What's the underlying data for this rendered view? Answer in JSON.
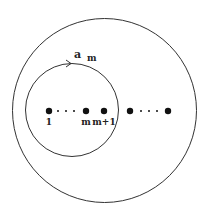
{
  "diagram": {
    "outer_circle": {
      "cx": 104.5,
      "cy": 110.5,
      "r": 92
    },
    "inner_circle": {
      "cx": 72,
      "cy": 110,
      "r": 46.5
    },
    "loop_label": {
      "main": "a",
      "sub": "m"
    },
    "points": [
      {
        "x": 49,
        "label": "1"
      },
      {
        "x": 86,
        "label": "m"
      },
      {
        "x": 104,
        "label": "m+1"
      },
      {
        "x": 130,
        "label": ""
      },
      {
        "x": 168,
        "label": ""
      }
    ],
    "ellipsis_dots_left": [
      58,
      66,
      74
    ],
    "ellipsis_dots_right": [
      141,
      149,
      157
    ],
    "point_y": 111,
    "label_y": 125,
    "stroke_color": "#333333",
    "dot_color": "#111111"
  }
}
